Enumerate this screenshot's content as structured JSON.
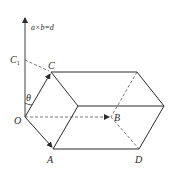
{
  "diagram": {
    "type": "parallelepiped-cross-product",
    "equation_label": "a×b=d",
    "labels": {
      "origin": "O",
      "A": "A",
      "B": "B",
      "C": "C",
      "D": "D",
      "C1_main": "C",
      "C1_sub": "1",
      "theta": "θ"
    },
    "colors": {
      "line": "#2b2b2b",
      "dashed": "#555555",
      "background": "#ffffff"
    },
    "vertices": {
      "O": [
        25,
        117
      ],
      "A": [
        53,
        149
      ],
      "B": [
        111,
        117
      ],
      "C": [
        51,
        72
      ],
      "C1": [
        25,
        60
      ],
      "D": [
        139,
        149
      ],
      "front_mid": [
        78,
        106
      ],
      "top_right": [
        137,
        72
      ],
      "right": [
        164,
        106
      ],
      "axis_tip": [
        25,
        17
      ]
    }
  }
}
